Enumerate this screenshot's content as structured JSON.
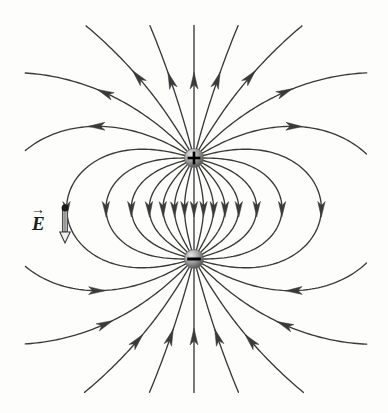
{
  "figure": {
    "name": "electric-dipole-field-lines",
    "width": 388,
    "height": 413,
    "background_color": "#fdfdfc",
    "line_color": "#3a3a3a",
    "line_width": 1.35
  },
  "charges": [
    {
      "id": "positive-charge",
      "sign": "+",
      "cx": 194,
      "cy": 158,
      "r": 9.5,
      "sphere_light": "#d6d6d6",
      "sphere_dark": "#4a4a4a",
      "glyph_color": "#000000"
    },
    {
      "id": "negative-charge",
      "sign": "−",
      "cx": 194,
      "cy": 259,
      "r": 9.5,
      "sphere_light": "#d6d6d6",
      "sphere_dark": "#4a4a4a",
      "glyph_color": "#000000"
    }
  ],
  "annotation": {
    "label": "E",
    "vector_accent": "→",
    "label_x": 32,
    "label_y": 214,
    "point_x": 65,
    "point_y": 208,
    "arrow_tip_x": 65,
    "arrow_tip_y": 243,
    "arrow_color": "#9a9a9a",
    "arrow_outline": "#3a3a3a",
    "dot_color": "#1a1a1a",
    "dot_r": 3.4
  },
  "chart_data": {
    "type": "vector-field",
    "xlabel": "",
    "ylabel": "",
    "grid": false,
    "legend": null,
    "charge_sources": [
      {
        "label": "+",
        "q": 1,
        "x": 194,
        "y": 158
      },
      {
        "label": "−",
        "q": -1,
        "x": 194,
        "y": 259
      }
    ],
    "field_line_count_per_charge": 24,
    "start_angle_step_deg": 15,
    "arrow_direction": "away from positive charge, into negative charge",
    "clip_bounds": {
      "x_min": 26,
      "x_max": 366,
      "y_min": 26,
      "y_max": 392
    }
  }
}
